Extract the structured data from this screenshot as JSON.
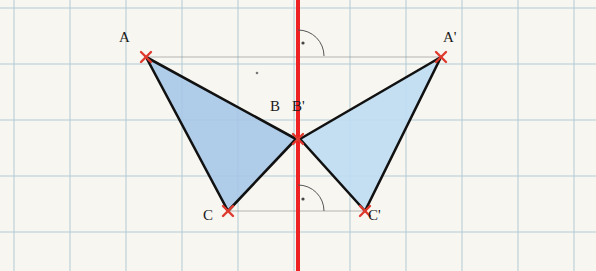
{
  "figure": {
    "type": "geometry-reflection-diagram",
    "background_color": "#f7f6f1",
    "grid": {
      "line_color": "#a8c4cf",
      "spacing_px": 56,
      "visible": true
    },
    "axis": {
      "name": "axis-of-symmetry",
      "color": "#ee2222",
      "orientation": "vertical",
      "x_px": 298,
      "width_px": 4
    },
    "triangles": [
      {
        "name": "triangle-ABC",
        "fill": "#a8c8e8",
        "stroke": "#111111",
        "vertices": [
          {
            "label": "A",
            "x": 146,
            "y": 57
          },
          {
            "label": "B",
            "x": 296,
            "y": 139
          },
          {
            "label": "C",
            "x": 228,
            "y": 211
          }
        ]
      },
      {
        "name": "triangle-A-prime-B-prime-C-prime",
        "fill": "#bfdcf2",
        "stroke": "#111111",
        "vertices": [
          {
            "label": "A'",
            "x": 441,
            "y": 57
          },
          {
            "label": "B'",
            "x": 300,
            "y": 139
          },
          {
            "label": "C'",
            "x": 365,
            "y": 211
          }
        ]
      }
    ],
    "point_markers": {
      "style": "red-x-cross",
      "color": "#e03a2f",
      "size_px": 9
    },
    "labels": [
      {
        "name": "label-A",
        "text": "A",
        "x": 124,
        "y": 36
      },
      {
        "name": "label-B",
        "text": "B",
        "x": 273,
        "y": 105
      },
      {
        "name": "label-B-prime",
        "text": "B'",
        "x": 296,
        "y": 105
      },
      {
        "name": "label-A-prime",
        "text": "A'",
        "x": 447,
        "y": 36
      },
      {
        "name": "label-C",
        "text": "C",
        "x": 207,
        "y": 212
      },
      {
        "name": "label-C-prime",
        "text": "C'",
        "x": 371,
        "y": 212
      }
    ],
    "right_angle_marks": [
      {
        "name": "right-angle-mark-top",
        "x": 298,
        "y": 44,
        "side": "right",
        "dot": true
      },
      {
        "name": "right-angle-mark-bottom",
        "x": 298,
        "y": 200,
        "side": "right",
        "dot": true
      }
    ],
    "construction_lines": [
      {
        "name": "perpendicular-segment-AA-prime",
        "from": [
          146,
          57
        ],
        "to": [
          441,
          57
        ],
        "style": "thin-gray"
      },
      {
        "name": "perpendicular-segment-CC-prime",
        "from": [
          228,
          211
        ],
        "to": [
          365,
          211
        ],
        "style": "thin-gray"
      }
    ]
  }
}
